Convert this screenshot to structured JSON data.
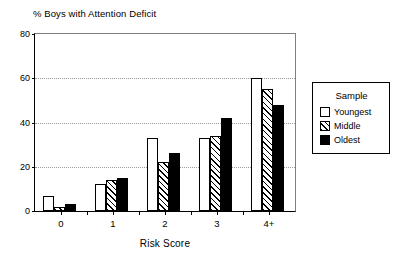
{
  "chart_data": {
    "type": "bar",
    "title": "% Boys with Attention Deficit",
    "xlabel": "Risk Score",
    "ylabel": "",
    "categories": [
      "0",
      "1",
      "2",
      "3",
      "4+"
    ],
    "series": [
      {
        "name": "Youngest",
        "values": [
          7,
          12,
          33,
          33,
          60
        ],
        "fill": "white"
      },
      {
        "name": "Middle",
        "values": [
          2,
          14,
          22,
          34,
          55
        ],
        "fill": "hatched"
      },
      {
        "name": "Oldest",
        "values": [
          3,
          15,
          26,
          42,
          48
        ],
        "fill": "black"
      }
    ],
    "ylim": [
      0,
      80
    ],
    "yticks": [
      0,
      20,
      40,
      60,
      80
    ],
    "ytick_labels": [
      "0",
      "20",
      "40",
      "60",
      "80"
    ],
    "grid": true,
    "grid_style": "dotted",
    "legend_position": "right-outside"
  },
  "legend": {
    "title": "Sample",
    "entries": [
      {
        "label": "Youngest"
      },
      {
        "label": "Middle"
      },
      {
        "label": "Oldest"
      }
    ]
  },
  "colors": {
    "axis": "#000000",
    "grid": "#9a9a9a",
    "bar_youngest": "#ffffff",
    "bar_oldest": "#000000",
    "background": "#ffffff"
  }
}
